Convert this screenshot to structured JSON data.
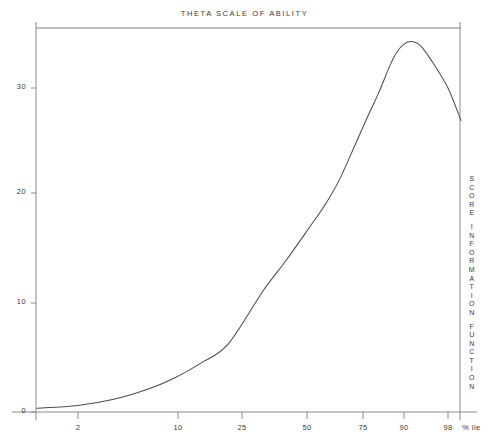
{
  "figure": {
    "title": "THETA SCALE OF ABILITY",
    "right_axis_label": "SCORE INFORMATION FUNCTION",
    "right_axis_label_words": [
      "SCORE",
      "INFORMATION",
      "FUNCTION"
    ],
    "percentile_unit": "% ile",
    "line_color": "#555555",
    "axis_color": "#777777",
    "background": "#ffffff"
  },
  "chart_data": {
    "type": "line",
    "title": "THETA SCALE OF ABILITY",
    "subtitle": "",
    "xlabel": "% ile",
    "ylabel": "SCORE INFORMATION FUNCTION",
    "grid": false,
    "legend": false,
    "xlim": [
      0,
      100
    ],
    "ylim": [
      0,
      36
    ],
    "xticks": [
      2,
      10,
      25,
      50,
      75,
      90,
      98
    ],
    "xtick_labels": [
      "2",
      "10",
      "25",
      "50",
      "75",
      "90",
      "98"
    ],
    "yticks": [
      0,
      10,
      20,
      30
    ],
    "ytick_labels": [
      "0",
      "10",
      "20",
      "30"
    ],
    "x_scale": "normal-probability (percentile)",
    "series": [
      {
        "name": "Score information function",
        "x": [
          0.6,
          2,
          5,
          10,
          16,
          25,
          35,
          50,
          60,
          70,
          75,
          80,
          85,
          88,
          90,
          92,
          93,
          94,
          95,
          96,
          97,
          98,
          98.6,
          99.2
        ],
        "y": [
          0.35,
          0.6,
          1.2,
          2.1,
          3.1,
          4.6,
          6.3,
          11.2,
          14.0,
          17.2,
          19.0,
          21.4,
          25.0,
          27.6,
          29.5,
          32.0,
          33.2,
          34.0,
          34.3,
          33.9,
          32.4,
          30.0,
          27.0,
          23.0
        ]
      }
    ],
    "annotations": [
      {
        "text": "peak",
        "x": 95,
        "y": 34.3
      }
    ]
  },
  "axes": {
    "y_tick_values": [
      "0",
      "10",
      "20",
      "30"
    ],
    "x_tick_values": [
      "2",
      "10",
      "25",
      "50",
      "75",
      "90",
      "98"
    ]
  }
}
